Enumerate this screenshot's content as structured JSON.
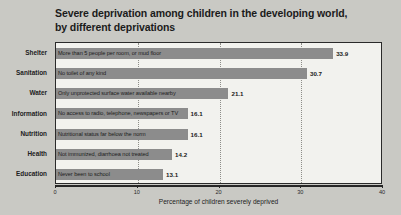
{
  "chart_data": {
    "type": "bar",
    "orientation": "horizontal",
    "title": "Severe deprivation among children in the developing world, by different deprivations",
    "title_lines": [
      "Severe deprivation among children in the developing world,",
      "by different deprivations"
    ],
    "xlabel": "Percentage of children severely deprived",
    "ylabel": "",
    "xlim": [
      0,
      40
    ],
    "xticks": [
      0,
      10,
      20,
      30,
      40
    ],
    "xtick_labels": [
      "0",
      "10",
      "20",
      "30",
      "40"
    ],
    "grid": true,
    "legend": "none",
    "bar_color": "#8c8c8c",
    "plot_background": "#f2f2ee",
    "page_background": "#c9c9c4",
    "categories": [
      "Shelter",
      "Sanitation",
      "Water",
      "Information",
      "Nutrition",
      "Health",
      "Education"
    ],
    "values": [
      33.9,
      30.7,
      21.1,
      16.1,
      16.1,
      14.2,
      13.1
    ],
    "annotations": [
      "More than 5 people per room, or mud floor",
      "No toilet of any kind",
      "Only unprotected surface water available nearby",
      "No access to radio, telephone, newspapers or TV",
      "Nutritional status far below the norm",
      "Not immunized, diarrhoea not treated",
      "Never been to school"
    ],
    "value_labels": [
      "33.9",
      "30.7",
      "21.1",
      "16.1",
      "16.1",
      "14.2",
      "13.1"
    ]
  }
}
